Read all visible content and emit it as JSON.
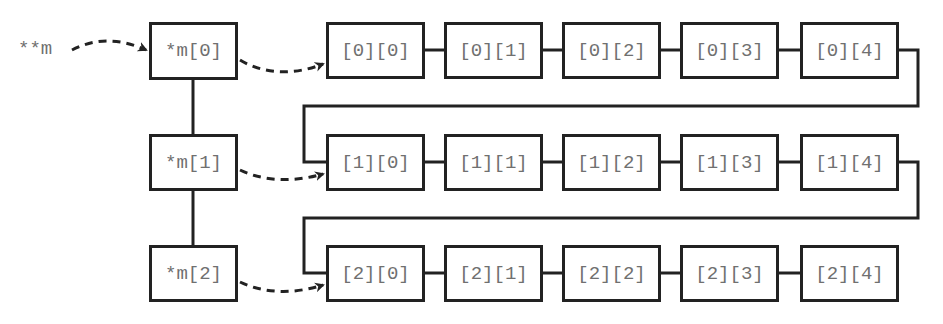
{
  "diagram": {
    "title": "",
    "root_pointer": {
      "label": "**m"
    },
    "row_pointers": [
      {
        "label": "*m[0]"
      },
      {
        "label": "*m[1]"
      },
      {
        "label": "*m[2]"
      }
    ],
    "cells": [
      [
        {
          "label": "[0][0]"
        },
        {
          "label": "[0][1]"
        },
        {
          "label": "[0][2]"
        },
        {
          "label": "[0][3]"
        },
        {
          "label": "[0][4]"
        }
      ],
      [
        {
          "label": "[1][0]"
        },
        {
          "label": "[1][1]"
        },
        {
          "label": "[1][2]"
        },
        {
          "label": "[1][3]"
        },
        {
          "label": "[1][4]"
        }
      ],
      [
        {
          "label": "[2][0]"
        },
        {
          "label": "[2][1]"
        },
        {
          "label": "[2][2]"
        },
        {
          "label": "[2][3]"
        },
        {
          "label": "[2][4]"
        }
      ]
    ],
    "colors": {
      "stroke": "#222222",
      "text": "#707070",
      "background": "#ffffff"
    }
  }
}
